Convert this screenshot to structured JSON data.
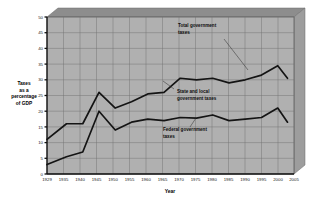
{
  "chart_data": {
    "type": "line",
    "title": "",
    "xlabel": "Year",
    "ylabel": "Taxes as a percentage of GDP",
    "ylabel_lines": [
      "Taxes",
      "as a",
      "percentage",
      "of GDP"
    ],
    "x": [
      1929,
      1935,
      1940,
      1945,
      1950,
      1955,
      1960,
      1965,
      1970,
      1975,
      1980,
      1985,
      1990,
      1995,
      2000,
      2003
    ],
    "xticks": [
      "1929",
      "1935",
      "1940",
      "1945",
      "1950",
      "1955",
      "1960",
      "1965",
      "1970",
      "1975",
      "1980",
      "1985",
      "1990",
      "1995",
      "2000",
      "2005"
    ],
    "yticks": [
      "0",
      "5",
      "10",
      "15",
      "20",
      "25",
      "30",
      "35",
      "40",
      "45",
      "50"
    ],
    "xlim": [
      1929,
      2005
    ],
    "ylim": [
      0,
      50
    ],
    "grid": true,
    "legend": "none",
    "series": [
      {
        "name": "Total government taxes",
        "values": [
          11,
          16,
          16,
          26,
          21,
          23,
          25.5,
          26,
          30.5,
          30,
          30.5,
          29,
          30,
          31.5,
          34.5,
          30.5
        ]
      },
      {
        "name": "Federal government taxes",
        "values": [
          3,
          5.5,
          7,
          20,
          14,
          16.5,
          17.5,
          17,
          18,
          17.8,
          18.8,
          17,
          17.5,
          18,
          21,
          16.5
        ]
      }
    ],
    "annotations": [
      {
        "id": "total",
        "lines": [
          "Total government",
          "taxes"
        ]
      },
      {
        "id": "state-local",
        "lines": [
          "State and local",
          "government taxes"
        ]
      },
      {
        "id": "federal",
        "lines": [
          "Federal government",
          "taxes"
        ]
      }
    ],
    "colors": {
      "plot_background": "#b0b0b0",
      "gridline": "#6f6f6f",
      "line": "#141414",
      "bevel_top": "#8d8d8d",
      "bevel_side": "#9a9a9a",
      "page_background": "#ffffff"
    }
  }
}
